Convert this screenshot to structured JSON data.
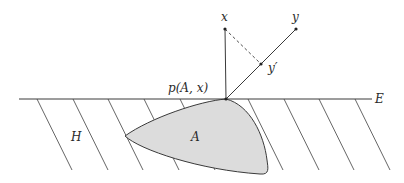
{
  "labels": {
    "x": "x",
    "y": "y",
    "y_prime": "y′",
    "p": "p(A, x)",
    "E": "E",
    "H": "H",
    "A": "A"
  },
  "colors": {
    "stroke": "#3a3a3a",
    "region_fill": "#dcdcdc",
    "hatch": "#555555",
    "background": "#ffffff"
  },
  "geometry": {
    "line_E": {
      "x1": 19,
      "y1": 99,
      "x2": 372,
      "y2": 99
    },
    "point_p": {
      "x": 226,
      "y": 99
    },
    "point_x": {
      "x": 225,
      "y": 29
    },
    "point_y": {
      "x": 296,
      "y": 29
    },
    "point_y_prime": {
      "x": 261,
      "y": 64
    },
    "hatch_top_x": [
      37,
      73,
      108,
      144,
      180,
      248,
      284,
      319,
      355
    ],
    "hatch_dx": 35,
    "hatch_top_y": 99,
    "hatch_bottom_y": 170
  }
}
